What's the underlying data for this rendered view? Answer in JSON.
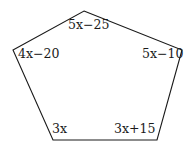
{
  "figure": {
    "shape": "pentagon",
    "stroke_color": "#1a1a1a",
    "vertices": [
      {
        "name": "top",
        "x": 84,
        "y": 11
      },
      {
        "name": "right",
        "x": 182,
        "y": 50
      },
      {
        "name": "bottom-right",
        "x": 157,
        "y": 140
      },
      {
        "name": "bottom-left",
        "x": 53,
        "y": 140
      },
      {
        "name": "left",
        "x": 13,
        "y": 50
      }
    ],
    "angles": [
      {
        "vertex": "top",
        "label": "5x−25"
      },
      {
        "vertex": "left",
        "label": "4x−20"
      },
      {
        "vertex": "right",
        "label": "5x−10"
      },
      {
        "vertex": "bottom-left",
        "label": "3x"
      },
      {
        "vertex": "bottom-right",
        "label": "3x+15"
      }
    ]
  }
}
